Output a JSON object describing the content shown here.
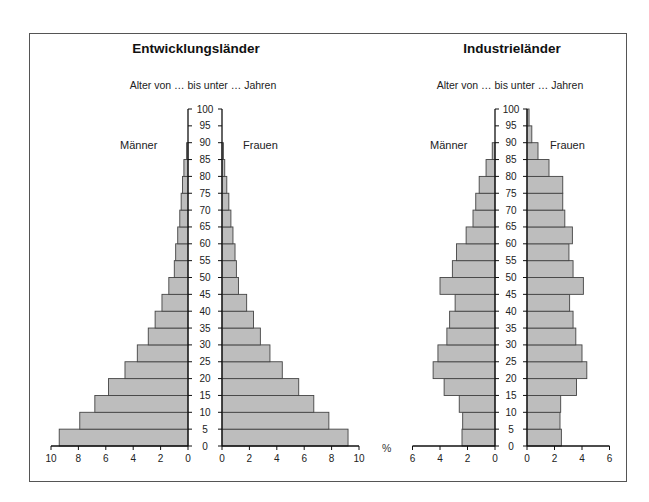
{
  "colors": {
    "bar_fill": "#bdbdbd",
    "bar_stroke": "#444444",
    "axis": "#111111",
    "frame": "#555555"
  },
  "left_chart": {
    "title": "Entwicklungsländer",
    "subtitle": "Alter von … bis unter … Jahren",
    "male_label": "Männer",
    "female_label": "Frauen"
  },
  "right_chart": {
    "title": "Industrieländer",
    "subtitle": "Alter von … bis unter … Jahren",
    "male_label": "Männer",
    "female_label": "Frauen"
  },
  "percent_label": "%",
  "chart_data": [
    {
      "type": "bar",
      "orientation": "horizontal-pyramid",
      "title": "Entwicklungsländer",
      "ylabel": "Alter von … bis unter … Jahren",
      "xlabel": "%",
      "age_groups": [
        "0-5",
        "5-10",
        "10-15",
        "15-20",
        "20-25",
        "25-30",
        "30-35",
        "35-40",
        "40-45",
        "45-50",
        "50-55",
        "55-60",
        "60-65",
        "65-70",
        "70-75",
        "75-80",
        "80-85",
        "85-90",
        "90-95",
        "95-100"
      ],
      "y_ticks": [
        0,
        5,
        10,
        15,
        20,
        25,
        30,
        35,
        40,
        45,
        50,
        55,
        60,
        65,
        70,
        75,
        80,
        85,
        90,
        95,
        100
      ],
      "x_ticks_male": [
        10,
        8,
        6,
        4,
        2,
        0
      ],
      "x_ticks_female": [
        0,
        2,
        4,
        6,
        8,
        10
      ],
      "xlim": [
        0,
        10
      ],
      "series": [
        {
          "name": "Männer",
          "values": [
            9.4,
            7.9,
            6.8,
            5.8,
            4.6,
            3.7,
            2.9,
            2.4,
            1.9,
            1.4,
            1.0,
            0.9,
            0.75,
            0.6,
            0.5,
            0.4,
            0.3,
            0.1,
            0,
            0
          ]
        },
        {
          "name": "Frauen",
          "values": [
            9.2,
            7.8,
            6.7,
            5.6,
            4.4,
            3.5,
            2.8,
            2.3,
            1.8,
            1.2,
            1.05,
            0.95,
            0.8,
            0.65,
            0.5,
            0.35,
            0.2,
            0.1,
            0,
            0
          ]
        }
      ],
      "grid": false,
      "legend": "inline labels (Männer left, Frauen right)"
    },
    {
      "type": "bar",
      "orientation": "horizontal-pyramid",
      "title": "Industrieländer",
      "ylabel": "Alter von … bis unter … Jahren",
      "xlabel": "%",
      "age_groups": [
        "0-5",
        "5-10",
        "10-15",
        "15-20",
        "20-25",
        "25-30",
        "30-35",
        "35-40",
        "40-45",
        "45-50",
        "50-55",
        "55-60",
        "60-65",
        "65-70",
        "70-75",
        "75-80",
        "80-85",
        "85-90",
        "90-95",
        "95-100"
      ],
      "y_ticks": [
        0,
        5,
        10,
        15,
        20,
        25,
        30,
        35,
        40,
        45,
        50,
        55,
        60,
        65,
        70,
        75,
        80,
        85,
        90,
        95,
        100
      ],
      "x_ticks_male": [
        6,
        4,
        2,
        0
      ],
      "x_ticks_female": [
        0,
        2,
        4,
        6
      ],
      "xlim": [
        0,
        6
      ],
      "series": [
        {
          "name": "Männer",
          "values": [
            2.4,
            2.35,
            2.6,
            3.7,
            4.5,
            4.15,
            3.5,
            3.3,
            2.9,
            4.0,
            3.1,
            2.8,
            2.1,
            1.6,
            1.4,
            1.15,
            0.65,
            0.2,
            0,
            0
          ]
        },
        {
          "name": "Frauen",
          "values": [
            2.5,
            2.4,
            2.45,
            3.6,
            4.35,
            4.0,
            3.55,
            3.35,
            3.1,
            4.1,
            3.35,
            3.05,
            3.3,
            2.75,
            2.6,
            2.6,
            1.6,
            0.8,
            0.35,
            0.15
          ]
        }
      ],
      "grid": false,
      "legend": "inline labels (Männer left, Frauen right)"
    }
  ]
}
